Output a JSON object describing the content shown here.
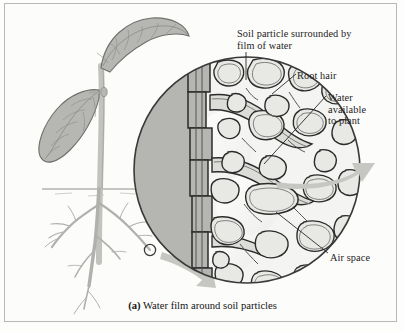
{
  "figure": {
    "caption_letter": "(a)",
    "caption_text": "Water film around soil particles",
    "background_color": "#fcfcfb",
    "border_color": "#b9b9b4",
    "ink_color": "#1d1d1d"
  },
  "labels": {
    "soil_particle": "Soil particle surrounded by\nfilm of water",
    "root_hair": "Root hair",
    "water_available": "Water\navailable\nto plant",
    "air_space": "Air space"
  },
  "illustration": {
    "plant": {
      "name": "seedling-with-two-leaves",
      "leaf_fill": "#b6b6b2",
      "leaf_vein_color": "#8a8a86",
      "stem_fill": "#c2c2be",
      "root_color": "#b0b0ac",
      "soil_line_color": "#8e8e8a"
    },
    "magnifier": {
      "name": "magnified-soil-circle",
      "root_interior_fill": "#b5b5b1",
      "soil_background_fill": "#f3f3f1",
      "particle_fill": "#e6e6e3",
      "particle_outline": "#2b2b2b",
      "water_film_color": "#6d6d6a",
      "air_space_fill": "#fbfbfa"
    },
    "arrows": {
      "fill": "#c6c6c2",
      "zoom_arrow_name": "zoom-indicator-arrow",
      "outflow_arrow_name": "water-uptake-arrow"
    },
    "marker_circle": {
      "name": "region-of-interest-circle",
      "outline": "#3a3a3a"
    }
  }
}
